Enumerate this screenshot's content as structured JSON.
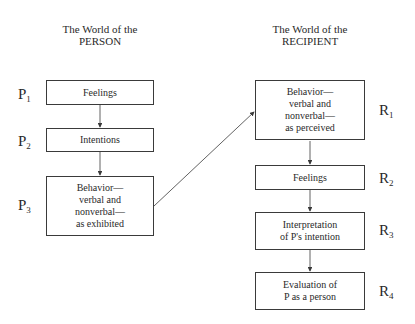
{
  "person": {
    "header_line1": "The World of the",
    "header_line2": "PERSON",
    "steps": [
      {
        "label": "P",
        "index": "1",
        "text": "Feelings"
      },
      {
        "label": "P",
        "index": "2",
        "text": "Intentions"
      },
      {
        "label": "P",
        "index": "3",
        "text": "Behavior—\nverbal and\nnonverbal—\nas exhibited"
      }
    ]
  },
  "recipient": {
    "header_line1": "The World of the",
    "header_line2": "RECIPIENT",
    "steps": [
      {
        "label": "R",
        "index": "1",
        "text": "Behavior—\nverbal and\nnonverbal—\nas perceived"
      },
      {
        "label": "R",
        "index": "2",
        "text": "Feelings"
      },
      {
        "label": "R",
        "index": "3",
        "text": "Interpretation\nof P's intention"
      },
      {
        "label": "R",
        "index": "4",
        "text": "Evaluation of\nP as a person"
      }
    ]
  }
}
